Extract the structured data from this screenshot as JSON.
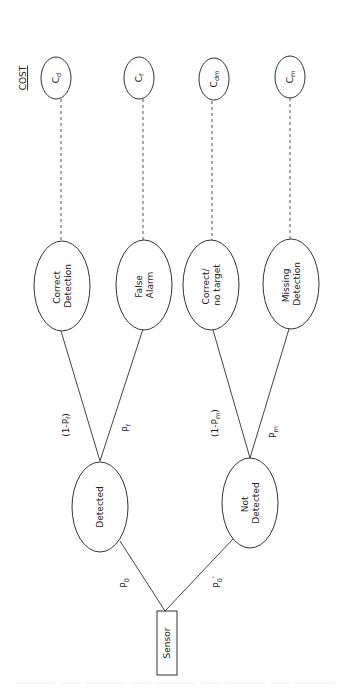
{
  "diagram": {
    "orientation": "rotated-90-ccw",
    "cost_header": "COST",
    "root": {
      "label": "Sensor"
    },
    "level1": [
      {
        "id": "detected",
        "label_lines": [
          "Detected"
        ]
      },
      {
        "id": "not_detected",
        "label_lines": [
          "Not",
          "Detected"
        ]
      }
    ],
    "level1_edges": [
      {
        "from": "Sensor",
        "to": "Detected",
        "prob_main": "P",
        "prob_sub": "0",
        "prob_sup": ""
      },
      {
        "from": "Sensor",
        "to": "Not Detected",
        "prob_main": "P",
        "prob_sub": "0",
        "prob_sup": "'"
      }
    ],
    "outcomes": [
      {
        "id": "correct_detection",
        "label_lines": [
          "Correct",
          "Detection"
        ],
        "cost_main": "C",
        "cost_sub": "d"
      },
      {
        "id": "false_alarm",
        "label_lines": [
          "False",
          "Alarm"
        ],
        "cost_main": "C",
        "cost_sub": "f"
      },
      {
        "id": "correct_no_target",
        "label_lines": [
          "Correct/",
          "no target"
        ],
        "cost_main": "C",
        "cost_sub": "dm"
      },
      {
        "id": "missing_detection",
        "label_lines": [
          "Missing",
          "Detection"
        ],
        "cost_main": "C",
        "cost_sub": "m"
      }
    ],
    "level2_edges": [
      {
        "from": "Detected",
        "to": "Correct Detection",
        "prob_pre": "(1-P",
        "prob_sub": "f",
        "prob_post": ")"
      },
      {
        "from": "Detected",
        "to": "False Alarm",
        "prob_pre": "P",
        "prob_sub": "f",
        "prob_post": ""
      },
      {
        "from": "Not Detected",
        "to": "Correct/no target",
        "prob_pre": "(1-P",
        "prob_sub": "m",
        "prob_post": ")"
      },
      {
        "from": "Not Detected",
        "to": "Missing Detection",
        "prob_pre": "P",
        "prob_sub": "m",
        "prob_post": ""
      }
    ]
  }
}
